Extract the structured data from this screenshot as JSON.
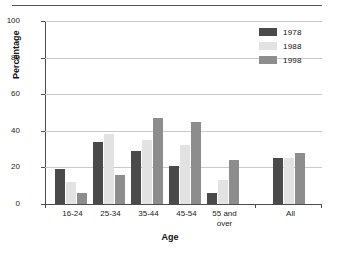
{
  "chart_data": {
    "type": "bar",
    "title": "",
    "xlabel": "Age",
    "ylabel": "Percentage",
    "ylim": [
      0,
      100
    ],
    "yticks": [
      0,
      20,
      40,
      60,
      80,
      100
    ],
    "grid": true,
    "legend_position": "top-right",
    "categories": [
      "16-24",
      "25-34",
      "35-44",
      "45-54",
      "55 and\nover",
      "All"
    ],
    "series": [
      {
        "name": "1978",
        "color": "#4a4a4a",
        "values": [
          19,
          34,
          29,
          21,
          6,
          25
        ]
      },
      {
        "name": "1988",
        "color": "#e2e2e2",
        "values": [
          12,
          38,
          35,
          32,
          13,
          25
        ]
      },
      {
        "name": "1998",
        "color": "#8d8d8d",
        "values": [
          6,
          16,
          47,
          45,
          24,
          28
        ]
      }
    ]
  },
  "axis": {
    "y_title": "Percentage",
    "x_title": "Age",
    "tick_labels": [
      "0",
      "20",
      "40",
      "60",
      "80",
      "100"
    ]
  },
  "legend": {
    "items": [
      {
        "label": "1978"
      },
      {
        "label": "1988"
      },
      {
        "label": "1998"
      }
    ]
  },
  "categories": [
    {
      "label": "16-24"
    },
    {
      "label": "25-34"
    },
    {
      "label": "35-44"
    },
    {
      "label": "45-54"
    },
    {
      "label": "55 and\nover"
    },
    {
      "label": "All"
    }
  ]
}
